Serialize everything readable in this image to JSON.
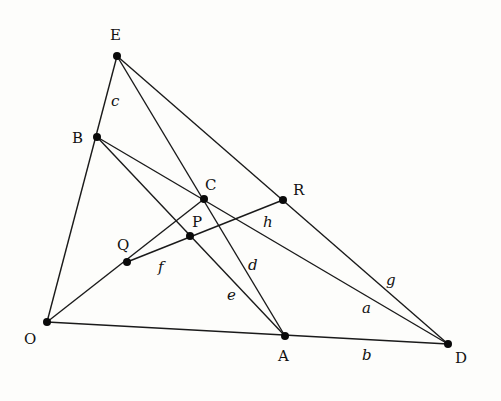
{
  "diagram": {
    "title": "",
    "points": [
      {
        "id": "E",
        "label": "E",
        "x": 117,
        "y": 56,
        "lx": 110,
        "ly": 40
      },
      {
        "id": "B",
        "label": "B",
        "x": 97,
        "y": 137,
        "lx": 72,
        "ly": 143
      },
      {
        "id": "O",
        "label": "O",
        "x": 47,
        "y": 322,
        "lx": 24,
        "ly": 344
      },
      {
        "id": "Q",
        "label": "Q",
        "x": 127,
        "y": 262,
        "lx": 117,
        "ly": 250
      },
      {
        "id": "P",
        "label": "P",
        "x": 190,
        "y": 236,
        "lx": 192,
        "ly": 227
      },
      {
        "id": "C",
        "label": "C",
        "x": 204,
        "y": 199,
        "lx": 205,
        "ly": 190
      },
      {
        "id": "R",
        "label": "R",
        "x": 283,
        "y": 200,
        "lx": 293,
        "ly": 195
      },
      {
        "id": "A",
        "label": "A",
        "x": 285,
        "y": 336,
        "lx": 278,
        "ly": 361
      },
      {
        "id": "D",
        "label": "D",
        "x": 448,
        "y": 344,
        "lx": 455,
        "ly": 363
      }
    ],
    "segments": [
      {
        "from": "E",
        "to": "O"
      },
      {
        "from": "O",
        "to": "D"
      },
      {
        "from": "E",
        "to": "D"
      },
      {
        "from": "E",
        "to": "A"
      },
      {
        "from": "B",
        "to": "A"
      },
      {
        "from": "B",
        "to": "D"
      },
      {
        "from": "O",
        "to": "C"
      },
      {
        "from": "Q",
        "to": "R"
      }
    ],
    "segment_labels": [
      {
        "label": "a",
        "x": 362,
        "y": 313
      },
      {
        "label": "b",
        "x": 362,
        "y": 360
      },
      {
        "label": "c",
        "x": 111,
        "y": 106
      },
      {
        "label": "d",
        "x": 248,
        "y": 270
      },
      {
        "label": "e",
        "x": 227,
        "y": 300
      },
      {
        "label": "f",
        "x": 158,
        "y": 272
      },
      {
        "label": "g",
        "x": 386,
        "y": 285
      },
      {
        "label": "h",
        "x": 263,
        "y": 227
      }
    ]
  }
}
